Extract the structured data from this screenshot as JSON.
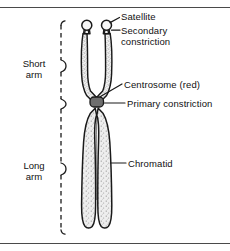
{
  "figure": {
    "background_color": "#ffffff",
    "ink_color": "#111111",
    "rule_color": "#4a4a4a",
    "chromatid_fill": "#e8e8e8",
    "chromatid_outline": "#1a1a1a",
    "centromere_fill": "#6e6e6e"
  },
  "labels": {
    "satellite": "Satellite",
    "secondary_constriction_line1": "Secondary",
    "secondary_constriction_line2": "constriction",
    "centrosome": "Centrosome (red)",
    "primary_constriction": "Primary constriction",
    "chromatid": "Chromatid"
  },
  "arms": {
    "short_line1": "Short",
    "short_line2": "arm",
    "long_line1": "Long",
    "long_line2": "arm"
  }
}
